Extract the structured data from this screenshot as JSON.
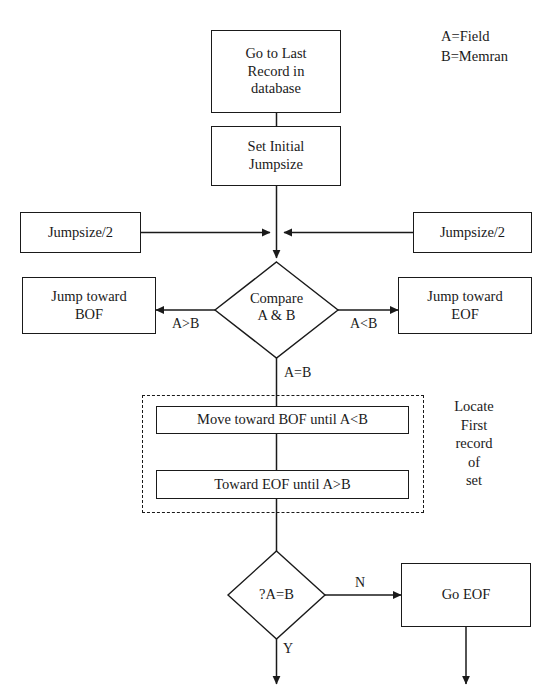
{
  "diagram": {
    "type": "flowchart",
    "colors": {
      "stroke": "#1a1a1a",
      "fill": "#ffffff",
      "text": "#1a1a1a"
    },
    "legend": {
      "line1": "A=Field",
      "line2": "B=Memran"
    },
    "annotation": {
      "locate_group": "Locate\nFirst\nrecord\nof\nset"
    },
    "nodes": {
      "go_last_record": "Go to Last\nRecord in\ndatabase",
      "set_initial_jumpsize": "Set Initial\nJumpsize",
      "jumpsize_half_left": "Jumpsize/2",
      "jumpsize_half_right": "Jumpsize/2",
      "compare": "Compare\nA & B",
      "jump_toward_bof": "Jump toward\nBOF",
      "jump_toward_eof": "Jump toward\nEOF",
      "move_toward_bof": "Move toward BOF until A<B",
      "toward_eof": "Toward EOF until A>B",
      "check_a_equals_b": "?A=B",
      "go_eof": "Go EOF"
    },
    "edge_labels": {
      "a_greater_b": "A>B",
      "a_less_b": "A<B",
      "a_equals_b": "A=B",
      "no": "N",
      "yes": "Y"
    }
  }
}
